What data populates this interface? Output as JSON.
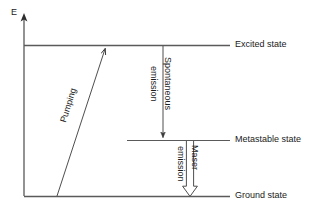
{
  "diagram": {
    "axis": {
      "label": "E",
      "name": "energy-axis",
      "arrow": "up-arrow"
    },
    "levels": [
      {
        "id": "excited",
        "label": "Excited state",
        "y": 45,
        "x_start": 24,
        "x_end": 230
      },
      {
        "id": "metastable",
        "label": "Metastable state",
        "y": 140,
        "x_start": 127,
        "x_end": 230
      },
      {
        "id": "ground",
        "label": "Ground state",
        "y": 196,
        "x_start": 24,
        "x_end": 230
      }
    ],
    "transitions": [
      {
        "id": "pumping",
        "label": "Pumping",
        "from": "ground",
        "to": "excited",
        "direction": "up",
        "arrow_style": "solid-line",
        "x_start": 57,
        "y_start": 196,
        "x_end": 106,
        "y_end": 46
      },
      {
        "id": "spontaneous-emission",
        "label_line1": "Spontaneous",
        "label_line2": "emission",
        "from": "excited",
        "to": "metastable",
        "direction": "down",
        "arrow_style": "solid-line",
        "x": 163,
        "y_start": 46,
        "y_end": 140
      },
      {
        "id": "maser-emission",
        "label_line1": "Maser",
        "label_line2": "emission",
        "from": "metastable",
        "to": "ground",
        "direction": "down",
        "arrow_style": "hollow-block-arrow",
        "x": 190,
        "y_start": 141,
        "y_end": 196
      }
    ],
    "colors": {
      "line": "#444444",
      "text": "#1a1a1a",
      "background": "#ffffff"
    }
  }
}
